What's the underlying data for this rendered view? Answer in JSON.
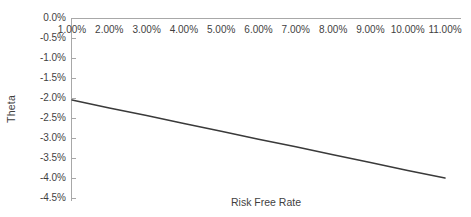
{
  "chart_data": {
    "type": "line",
    "title": "",
    "xlabel": "Risk Free Rate",
    "ylabel": "Theta",
    "grid": false,
    "legend": false,
    "legend_position": "none",
    "x": [
      0.01,
      0.02,
      0.03,
      0.04,
      0.05,
      0.06,
      0.07,
      0.08,
      0.09,
      0.1,
      0.11
    ],
    "x_tick_labels": [
      "1.00%",
      "2.00%",
      "3.00%",
      "4.00%",
      "5.00%",
      "6.00%",
      "7.00%",
      "8.00%",
      "9.00%",
      "10.00%",
      "11.00%"
    ],
    "x_axis_position": "top",
    "xlim": [
      0.01,
      0.11
    ],
    "y_tick_labels": [
      "0.0%",
      "-0.5%",
      "-1.0%",
      "-1.5%",
      "-2.0%",
      "-2.5%",
      "-3.0%",
      "-3.5%",
      "-4.0%",
      "-4.5%"
    ],
    "y_ticks": [
      0.0,
      -0.005,
      -0.01,
      -0.015,
      -0.02,
      -0.025,
      -0.03,
      -0.035,
      -0.04,
      -0.045
    ],
    "ylim": [
      -0.045,
      0.0
    ],
    "y_inverted": false,
    "series": [
      {
        "name": "Theta",
        "color": "#3a3a3a",
        "values": [
          -0.0205,
          -0.0225,
          -0.0244,
          -0.0264,
          -0.0283,
          -0.0303,
          -0.0322,
          -0.0342,
          -0.0361,
          -0.0381,
          -0.04
        ]
      }
    ]
  },
  "axes": {
    "y_title": "Theta",
    "x_title": "Risk Free Rate",
    "axis_color": "#a8a8a8",
    "text_color": "#3f3f3f",
    "background": "#ffffff"
  }
}
